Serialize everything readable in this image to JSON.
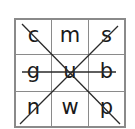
{
  "puzzle": {
    "type": "3x3 letter grid with crossing strike lines",
    "rows": [
      [
        "c",
        "m",
        "s"
      ],
      [
        "g",
        "u",
        "b"
      ],
      [
        "n",
        "w",
        "p"
      ]
    ],
    "cells": [
      {
        "letter": "c",
        "row": 1,
        "col": 1
      },
      {
        "letter": "m",
        "row": 1,
        "col": 2
      },
      {
        "letter": "s",
        "row": 1,
        "col": 3
      },
      {
        "letter": "g",
        "row": 2,
        "col": 1
      },
      {
        "letter": "u",
        "row": 2,
        "col": 2
      },
      {
        "letter": "b",
        "row": 2,
        "col": 3
      },
      {
        "letter": "n",
        "row": 3,
        "col": 1
      },
      {
        "letter": "w",
        "row": 3,
        "col": 2
      },
      {
        "letter": "p",
        "row": 3,
        "col": 3
      }
    ],
    "strike_lines": [
      {
        "name": "diagonal-top-left-to-bottom-right",
        "through": [
          "c",
          "u",
          "p"
        ]
      },
      {
        "name": "diagonal-top-right-to-bottom-left",
        "through": [
          "s",
          "u",
          "n"
        ]
      },
      {
        "name": "horizontal-middle-row",
        "through": [
          "g",
          "u",
          "b"
        ]
      }
    ],
    "colors": {
      "grid_line": "#8a8a8a",
      "letter": "#1a1a1a",
      "strike_line": "#2a2a2a",
      "background": "#ffffff"
    }
  }
}
